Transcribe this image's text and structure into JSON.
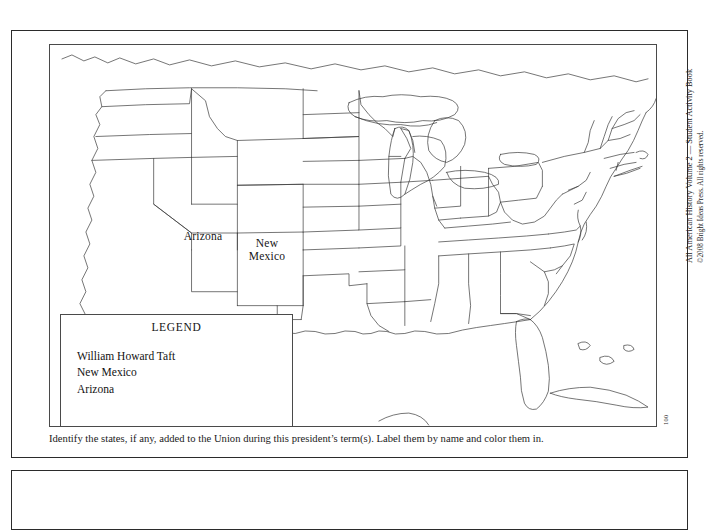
{
  "document": {
    "credit_line_1": "All American History Volume 2 — Student Activity Book",
    "credit_line_2": "©2008 Bright Ideas Press. All rights reserved.",
    "page_number": "100"
  },
  "map": {
    "title": "United States outline map",
    "state_labels": [
      {
        "name": "arizona",
        "text": "Arizona"
      },
      {
        "name": "new-mexico",
        "text": "New\nMexico"
      }
    ]
  },
  "legend": {
    "title": "LEGEND",
    "items": [
      "William Howard Taft",
      "New Mexico",
      "Arizona"
    ]
  },
  "instruction": {
    "text": "Identify the states, if any, added to the Union during this president’s term(s). Label them by name and color them in."
  },
  "colors": {
    "panel_border": "#2b2b2b",
    "map_line": "#3a3a3a",
    "text": "#121212",
    "background": "#ffffff"
  }
}
